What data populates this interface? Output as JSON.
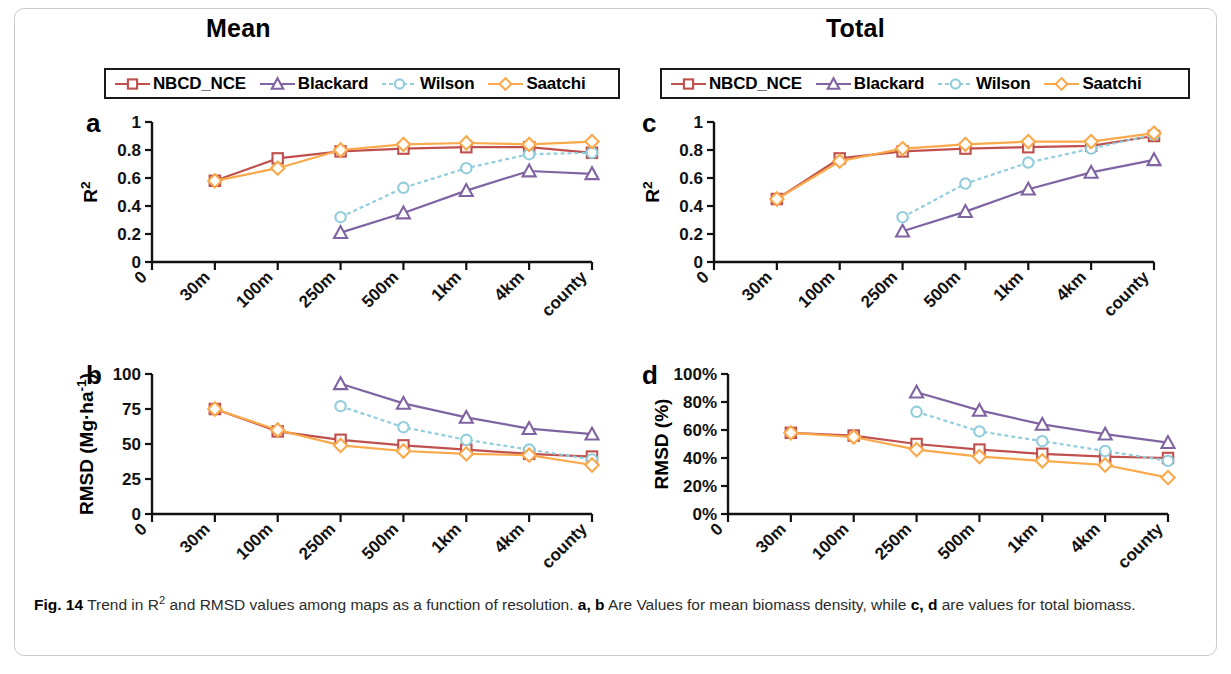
{
  "figure": {
    "number": "Fig. 14",
    "caption_part1": "Trend in R",
    "caption_sup": "2",
    "caption_part2": " and RMSD values among maps as a function of resolution. ",
    "caption_bold_ab": "a, b",
    "caption_part3": " Are Values for mean biomass density, while ",
    "caption_bold_cd": "c, d",
    "caption_part4": " are values for total biomass."
  },
  "columns": {
    "left_title": "Mean",
    "right_title": "Total"
  },
  "legend": {
    "entries": [
      {
        "label": "NBCD_NCE",
        "color": "#C0504D",
        "marker": "square",
        "dash": "solid"
      },
      {
        "label": "Blackard",
        "color": "#8064A2",
        "marker": "triangle",
        "dash": "solid"
      },
      {
        "label": "Wilson",
        "color": "#92CDDC",
        "marker": "circle",
        "dash": "dashed"
      },
      {
        "label": "Saatchi",
        "color": "#F9A94A",
        "marker": "diamond",
        "dash": "solid"
      }
    ]
  },
  "colors": {
    "nbcd": "#C0504D",
    "blackard": "#8064A2",
    "wilson": "#92CDDC",
    "saatchi": "#F9A94A",
    "axis": "#111111",
    "frame": "#c9c9c9"
  },
  "chart_data": [
    {
      "id": "panel-a",
      "panel_letter": "a",
      "type": "line",
      "title": "Mean",
      "xlabel": "",
      "ylabel": "R²",
      "ylabel_text": "R2",
      "categories": [
        "0",
        "30m",
        "100m",
        "250m",
        "500m",
        "1km",
        "4km",
        "county"
      ],
      "xtick_labels": [
        "0",
        "30m",
        "100m",
        "250m",
        "500m",
        "1km",
        "4km",
        "county"
      ],
      "ytick_labels": [
        "0",
        "0.2",
        "0.4",
        "0.6",
        "0.8",
        "1"
      ],
      "yticks": [
        0,
        0.2,
        0.4,
        0.6,
        0.8,
        1
      ],
      "ylim": [
        0,
        1
      ],
      "grid": false,
      "legend_position": "above",
      "series": [
        {
          "name": "NBCD_NCE",
          "color": "#C0504D",
          "marker": "square",
          "dash": "solid",
          "x": [
            "30m",
            "100m",
            "250m",
            "500m",
            "1km",
            "4km",
            "county"
          ],
          "values": [
            0.58,
            0.74,
            0.79,
            0.81,
            0.82,
            0.82,
            0.78
          ]
        },
        {
          "name": "Blackard",
          "color": "#8064A2",
          "marker": "triangle",
          "dash": "solid",
          "x": [
            "250m",
            "500m",
            "1km",
            "4km",
            "county"
          ],
          "values": [
            0.21,
            0.35,
            0.51,
            0.65,
            0.63
          ]
        },
        {
          "name": "Wilson",
          "color": "#92CDDC",
          "marker": "circle",
          "dash": "dashed",
          "x": [
            "250m",
            "500m",
            "1km",
            "4km",
            "county"
          ],
          "values": [
            0.32,
            0.53,
            0.67,
            0.77,
            0.78
          ]
        },
        {
          "name": "Saatchi",
          "color": "#F9A94A",
          "marker": "diamond",
          "dash": "solid",
          "x": [
            "30m",
            "100m",
            "250m",
            "500m",
            "1km",
            "4km",
            "county"
          ],
          "values": [
            0.58,
            0.67,
            0.8,
            0.84,
            0.85,
            0.84,
            0.86
          ]
        }
      ]
    },
    {
      "id": "panel-b",
      "panel_letter": "b",
      "type": "line",
      "title": "Mean",
      "xlabel": "",
      "ylabel": "RMSD (Mg·ha⁻¹)",
      "ylabel_text": "RMSD (Mg ha-1)",
      "categories": [
        "0",
        "30m",
        "100m",
        "250m",
        "500m",
        "1km",
        "4km",
        "county"
      ],
      "xtick_labels": [
        "0",
        "30m",
        "100m",
        "250m",
        "500m",
        "1km",
        "4km",
        "county"
      ],
      "ytick_labels": [
        "0",
        "25",
        "50",
        "75",
        "100"
      ],
      "yticks": [
        0,
        25,
        50,
        75,
        100
      ],
      "ylim": [
        0,
        100
      ],
      "grid": false,
      "legend_position": "above",
      "series": [
        {
          "name": "NBCD_NCE",
          "color": "#C0504D",
          "marker": "square",
          "dash": "solid",
          "x": [
            "30m",
            "100m",
            "250m",
            "500m",
            "1km",
            "4km",
            "county"
          ],
          "values": [
            75,
            59,
            53,
            49,
            46,
            43,
            41
          ]
        },
        {
          "name": "Blackard",
          "color": "#8064A2",
          "marker": "triangle",
          "dash": "solid",
          "x": [
            "250m",
            "500m",
            "1km",
            "4km",
            "county"
          ],
          "values": [
            93,
            79,
            69,
            61,
            57
          ]
        },
        {
          "name": "Wilson",
          "color": "#92CDDC",
          "marker": "circle",
          "dash": "dashed",
          "x": [
            "250m",
            "500m",
            "1km",
            "4km",
            "county"
          ],
          "values": [
            77,
            62,
            53,
            46,
            39
          ]
        },
        {
          "name": "Saatchi",
          "color": "#F9A94A",
          "marker": "diamond",
          "dash": "solid",
          "x": [
            "30m",
            "100m",
            "250m",
            "500m",
            "1km",
            "4km",
            "county"
          ],
          "values": [
            75,
            60,
            49,
            45,
            43,
            42,
            35
          ]
        }
      ]
    },
    {
      "id": "panel-c",
      "panel_letter": "c",
      "type": "line",
      "title": "Total",
      "xlabel": "",
      "ylabel": "R²",
      "ylabel_text": "R2",
      "categories": [
        "0",
        "30m",
        "100m",
        "250m",
        "500m",
        "1km",
        "4km",
        "county"
      ],
      "xtick_labels": [
        "0",
        "30m",
        "100m",
        "250m",
        "500m",
        "1km",
        "4km",
        "county"
      ],
      "ytick_labels": [
        "0",
        "0.2",
        "0.4",
        "0.6",
        "0.8",
        "1"
      ],
      "yticks": [
        0,
        0.2,
        0.4,
        0.6,
        0.8,
        1
      ],
      "ylim": [
        0,
        1
      ],
      "grid": false,
      "legend_position": "above",
      "series": [
        {
          "name": "NBCD_NCE",
          "color": "#C0504D",
          "marker": "square",
          "dash": "solid",
          "x": [
            "30m",
            "100m",
            "250m",
            "500m",
            "1km",
            "4km",
            "county"
          ],
          "values": [
            0.45,
            0.74,
            0.79,
            0.81,
            0.82,
            0.83,
            0.9
          ]
        },
        {
          "name": "Blackard",
          "color": "#8064A2",
          "marker": "triangle",
          "dash": "solid",
          "x": [
            "250m",
            "500m",
            "1km",
            "4km",
            "county"
          ],
          "values": [
            0.22,
            0.36,
            0.52,
            0.64,
            0.73
          ]
        },
        {
          "name": "Wilson",
          "color": "#92CDDC",
          "marker": "circle",
          "dash": "dashed",
          "x": [
            "250m",
            "500m",
            "1km",
            "4km",
            "county"
          ],
          "values": [
            0.32,
            0.56,
            0.71,
            0.81,
            0.91
          ]
        },
        {
          "name": "Saatchi",
          "color": "#F9A94A",
          "marker": "diamond",
          "dash": "solid",
          "x": [
            "30m",
            "100m",
            "250m",
            "500m",
            "1km",
            "4km",
            "county"
          ],
          "values": [
            0.45,
            0.72,
            0.81,
            0.84,
            0.86,
            0.86,
            0.92
          ]
        }
      ]
    },
    {
      "id": "panel-d",
      "panel_letter": "d",
      "type": "line",
      "title": "Total",
      "xlabel": "",
      "ylabel": "RMSD (%)",
      "ylabel_text": "RMSD (%)",
      "categories": [
        "0",
        "30m",
        "100m",
        "250m",
        "500m",
        "1km",
        "4km",
        "county"
      ],
      "xtick_labels": [
        "0",
        "30m",
        "100m",
        "250m",
        "500m",
        "1km",
        "4km",
        "county"
      ],
      "ytick_labels": [
        "0%",
        "20%",
        "40%",
        "60%",
        "80%",
        "100%"
      ],
      "yticks": [
        0,
        20,
        40,
        60,
        80,
        100
      ],
      "ylim": [
        0,
        100
      ],
      "grid": false,
      "legend_position": "above",
      "series": [
        {
          "name": "NBCD_NCE",
          "color": "#C0504D",
          "marker": "square",
          "dash": "solid",
          "x": [
            "30m",
            "100m",
            "250m",
            "500m",
            "1km",
            "4km",
            "county"
          ],
          "values": [
            58,
            56,
            50,
            46,
            43,
            41,
            40
          ]
        },
        {
          "name": "Blackard",
          "color": "#8064A2",
          "marker": "triangle",
          "dash": "solid",
          "x": [
            "250m",
            "500m",
            "1km",
            "4km",
            "county"
          ],
          "values": [
            87,
            74,
            64,
            57,
            51
          ]
        },
        {
          "name": "Wilson",
          "color": "#92CDDC",
          "marker": "circle",
          "dash": "dashed",
          "x": [
            "250m",
            "500m",
            "1km",
            "4km",
            "county"
          ],
          "values": [
            73,
            59,
            52,
            45,
            38
          ]
        },
        {
          "name": "Saatchi",
          "color": "#F9A94A",
          "marker": "diamond",
          "dash": "solid",
          "x": [
            "30m",
            "100m",
            "250m",
            "500m",
            "1km",
            "4km",
            "county"
          ],
          "values": [
            58,
            55,
            46,
            41,
            38,
            35,
            26
          ]
        }
      ]
    }
  ]
}
